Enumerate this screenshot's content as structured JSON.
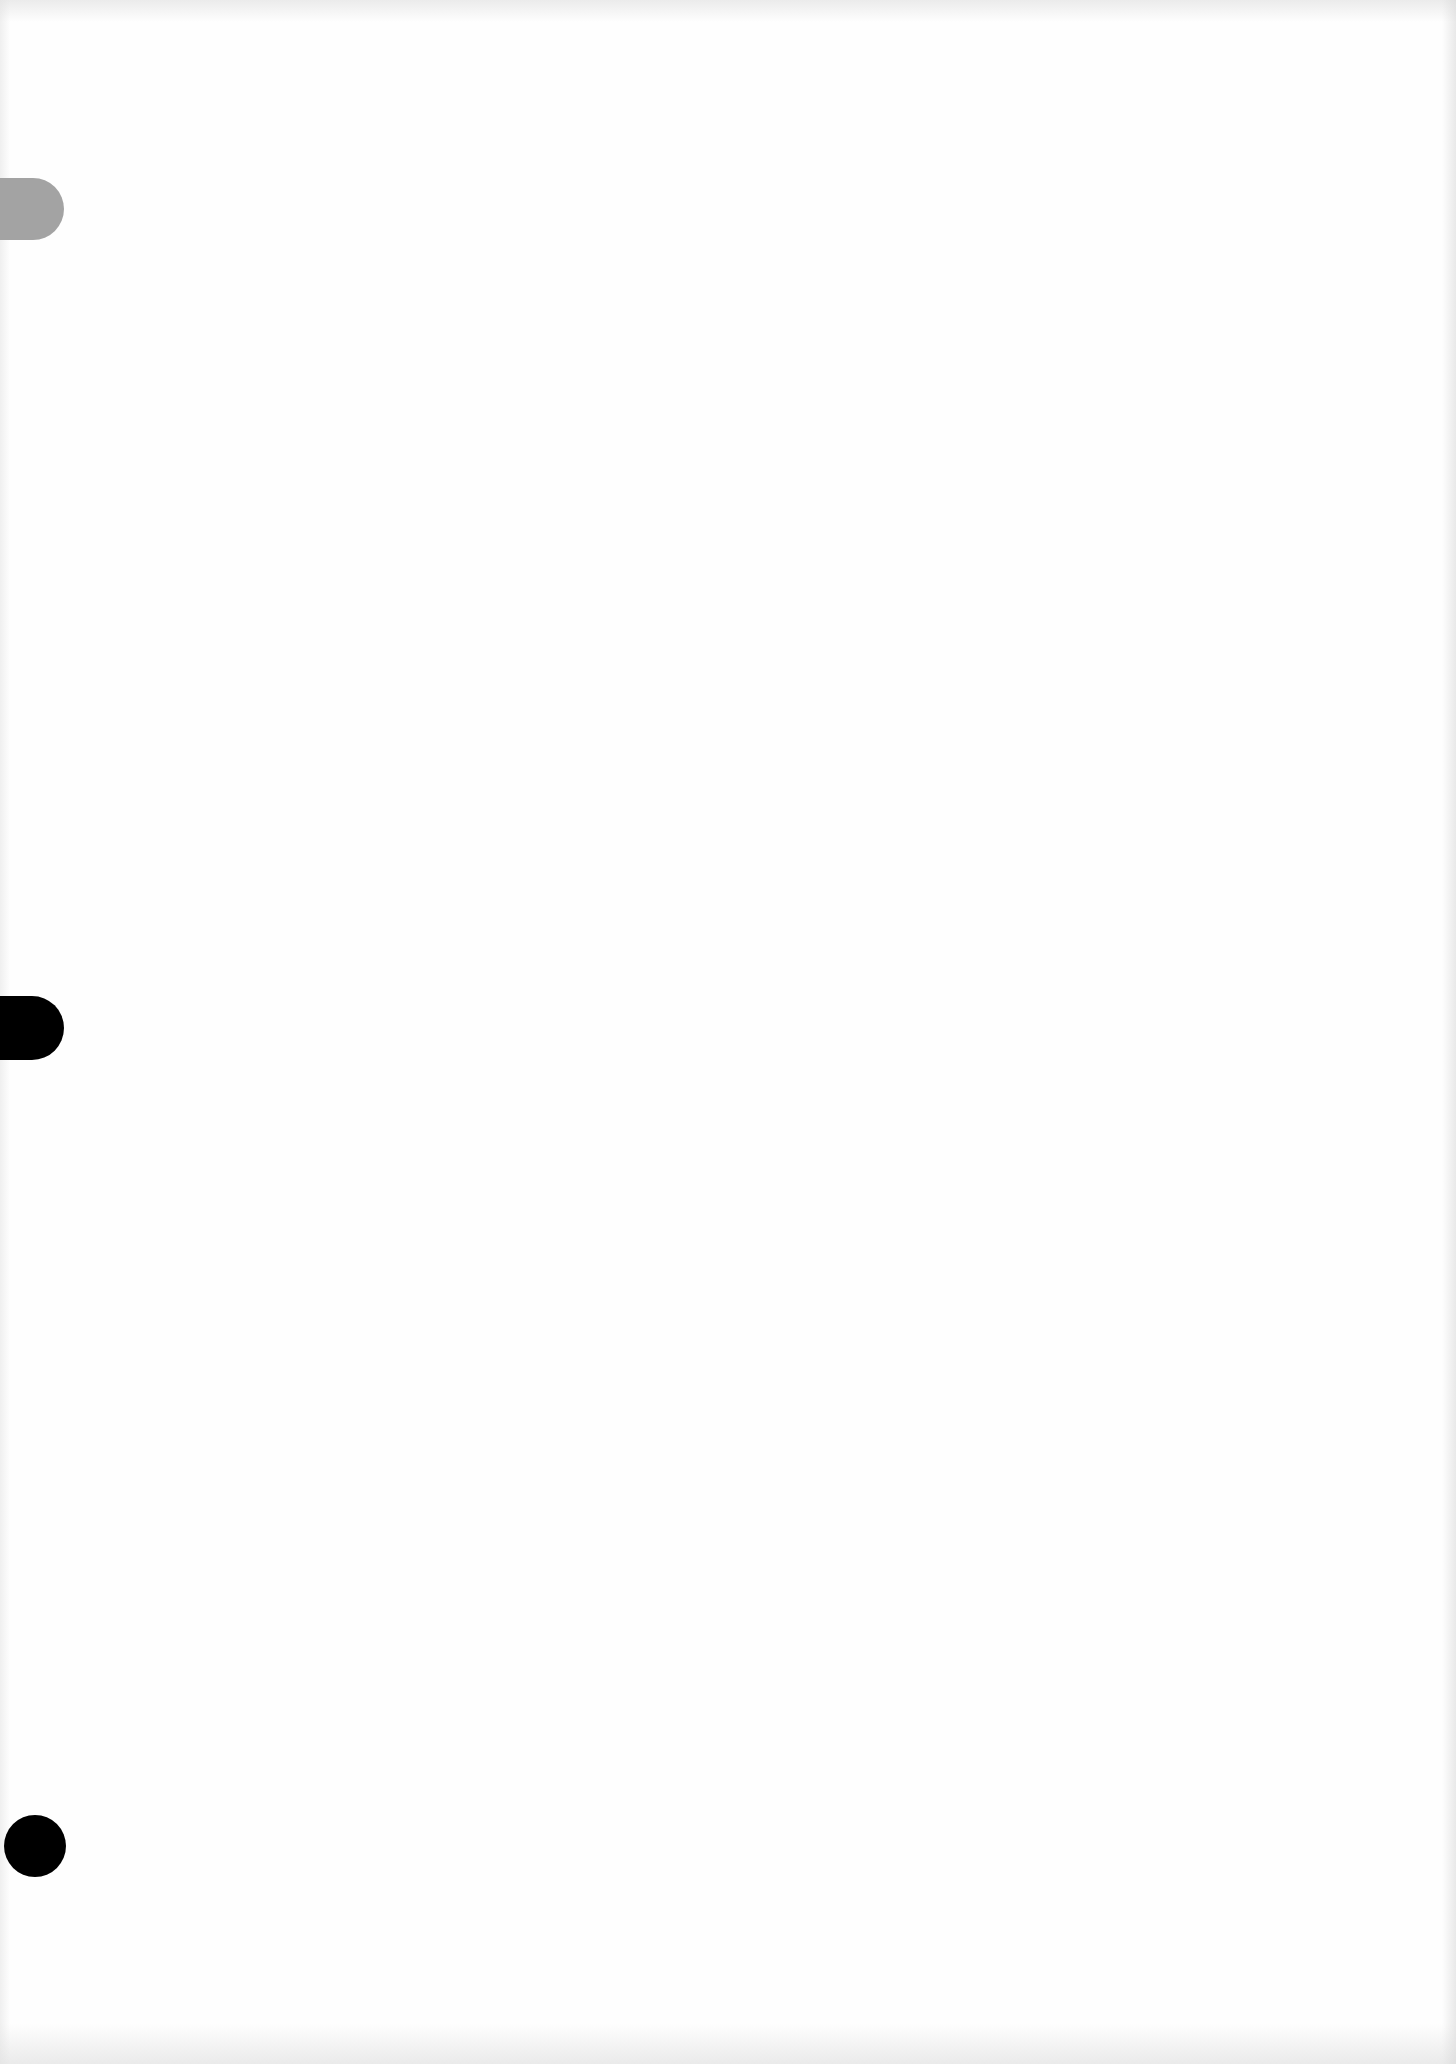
{
  "document": {
    "content": "",
    "is_blank": true
  },
  "punch_holes": [
    {
      "position": "top",
      "shape": "rounded-rectangle",
      "color": "#a3a3a3"
    },
    {
      "position": "middle",
      "shape": "circle",
      "color": "#000000"
    },
    {
      "position": "bottom",
      "shape": "circle",
      "color": "#000000"
    }
  ],
  "colors": {
    "paper": "#fefefe",
    "edge_noise": "#d2d2d2"
  }
}
